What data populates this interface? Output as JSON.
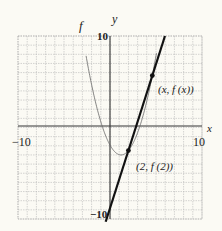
{
  "chart_data": {
    "type": "line",
    "title": "",
    "xlabel": "x",
    "ylabel": "y",
    "xlim": [
      -10,
      10
    ],
    "ylim": [
      -10,
      10
    ],
    "grid": true,
    "tick_labels": {
      "x_min": "−10",
      "x_max": "10",
      "y_min": "−10",
      "y_max": "10"
    },
    "series": [
      {
        "name": "f",
        "style": "thin curve",
        "description": "parabola with vertex near (1, -3)"
      },
      {
        "name": "secant",
        "style": "thick line",
        "through": [
          [
            2,
            -1
          ],
          [
            4.6,
            5.3
          ]
        ]
      }
    ],
    "annotations": [
      {
        "label": "(x, f (x))",
        "at": [
          4.6,
          5.3
        ]
      },
      {
        "label": "(2, f (2))",
        "at": [
          2,
          -1
        ]
      },
      {
        "label": "f",
        "at": [
          -2.2,
          10.5
        ]
      }
    ]
  }
}
